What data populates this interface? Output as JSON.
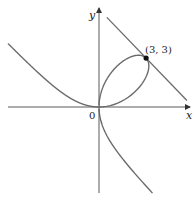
{
  "chart_data": {
    "type": "line",
    "title": "",
    "xlabel": "x",
    "ylabel": "y",
    "origin_label": "0",
    "series": [
      {
        "name": "folium",
        "equation": "x^3 + y^3 = 6xy",
        "color": "#6b6b6b"
      },
      {
        "name": "tangent",
        "equation": "x + y = 6",
        "color": "#6b6b6b"
      }
    ],
    "point": {
      "x": 3,
      "y": 3,
      "label": "(3, 3)",
      "color": "#111111"
    },
    "xlim": [
      -5.8,
      5.5
    ],
    "ylim": [
      -5.3,
      6.5
    ],
    "grid": false
  },
  "layout": {
    "origin_px": [
      99,
      107
    ],
    "scale_x": 15.7,
    "scale_y": 16.3,
    "axis_color": "#5a5a5a",
    "curve_color": "#6b6b6b"
  }
}
